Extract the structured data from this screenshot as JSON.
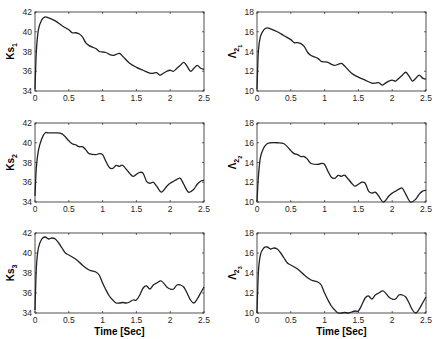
{
  "chart_data": [
    {
      "type": "line",
      "title": "",
      "ylabel": "Ks_1",
      "ylabel_main": "Ks",
      "ylabel_sub": "1",
      "xlabel": "",
      "xlim": [
        0,
        2.5
      ],
      "ylim": [
        34,
        42
      ],
      "xticks": [
        "0",
        "0.5",
        "1",
        "1.5",
        "2",
        "2.5"
      ],
      "yticks": [
        "34",
        "36",
        "38",
        "40",
        "42"
      ],
      "grid": false,
      "x": [
        0,
        0.02,
        0.05,
        0.1,
        0.15,
        0.2,
        0.3,
        0.4,
        0.5,
        0.55,
        0.6,
        0.65,
        0.7,
        0.75,
        0.8,
        0.9,
        0.95,
        1.0,
        1.05,
        1.1,
        1.15,
        1.2,
        1.25,
        1.3,
        1.4,
        1.5,
        1.6,
        1.7,
        1.75,
        1.8,
        1.85,
        1.9,
        1.95,
        2.0,
        2.05,
        2.1,
        2.15,
        2.2,
        2.25,
        2.3,
        2.35,
        2.4,
        2.45,
        2.5
      ],
      "values": [
        34.2,
        38.0,
        40.2,
        41.2,
        41.5,
        41.4,
        41.1,
        40.6,
        40.2,
        39.9,
        39.9,
        39.8,
        39.5,
        38.9,
        38.6,
        38.3,
        38.0,
        37.95,
        37.9,
        37.7,
        37.6,
        37.7,
        37.8,
        37.5,
        36.8,
        36.4,
        36.1,
        35.8,
        35.8,
        35.85,
        35.6,
        35.8,
        36.0,
        36.1,
        36.0,
        36.3,
        36.6,
        36.9,
        36.5,
        36.0,
        36.3,
        36.6,
        36.3,
        36.2
      ]
    },
    {
      "type": "line",
      "title": "",
      "ylabel": "Λ2_1",
      "ylabel_main": "Λ",
      "ylabel_sub": "2",
      "ylabel_subsub": "1",
      "xlabel": "",
      "xlim": [
        0,
        2.5
      ],
      "ylim": [
        10,
        18
      ],
      "xticks": [
        "0",
        "0.5",
        "1",
        "1.5",
        "2",
        "2.5"
      ],
      "yticks": [
        "10",
        "12",
        "14",
        "16",
        "18"
      ],
      "grid": false,
      "x": [
        0,
        0.02,
        0.05,
        0.1,
        0.15,
        0.2,
        0.3,
        0.4,
        0.5,
        0.55,
        0.6,
        0.65,
        0.7,
        0.75,
        0.8,
        0.9,
        0.95,
        1.0,
        1.05,
        1.1,
        1.15,
        1.2,
        1.25,
        1.3,
        1.4,
        1.5,
        1.6,
        1.7,
        1.75,
        1.8,
        1.85,
        1.9,
        1.95,
        2.0,
        2.05,
        2.1,
        2.15,
        2.2,
        2.25,
        2.3,
        2.35,
        2.4,
        2.45,
        2.5
      ],
      "values": [
        10.2,
        14.0,
        15.5,
        16.2,
        16.4,
        16.3,
        16.0,
        15.6,
        15.2,
        14.9,
        14.9,
        14.8,
        14.5,
        13.9,
        13.6,
        13.3,
        13.0,
        12.95,
        12.9,
        12.7,
        12.6,
        12.7,
        12.8,
        12.5,
        11.8,
        11.4,
        11.1,
        10.8,
        10.8,
        10.85,
        10.6,
        10.8,
        11.0,
        11.1,
        11.0,
        11.3,
        11.6,
        11.9,
        11.5,
        11.0,
        11.3,
        11.6,
        11.3,
        11.2
      ]
    },
    {
      "type": "line",
      "title": "",
      "ylabel": "Ks_2",
      "ylabel_main": "Ks",
      "ylabel_sub": "2",
      "xlabel": "",
      "xlim": [
        0,
        2.5
      ],
      "ylim": [
        34,
        42
      ],
      "xticks": [
        "0",
        "0.5",
        "1",
        "1.5",
        "2",
        "2.5"
      ],
      "yticks": [
        "34",
        "36",
        "38",
        "40",
        "42"
      ],
      "grid": false,
      "x": [
        0,
        0.02,
        0.05,
        0.1,
        0.15,
        0.2,
        0.3,
        0.4,
        0.5,
        0.55,
        0.6,
        0.65,
        0.7,
        0.75,
        0.8,
        0.9,
        0.95,
        1.0,
        1.05,
        1.1,
        1.15,
        1.2,
        1.25,
        1.3,
        1.4,
        1.45,
        1.5,
        1.55,
        1.6,
        1.65,
        1.7,
        1.75,
        1.8,
        1.87,
        1.95,
        2.0,
        2.05,
        2.1,
        2.15,
        2.2,
        2.27,
        2.35,
        2.4,
        2.45,
        2.5
      ],
      "values": [
        34.6,
        37.5,
        39.2,
        40.4,
        41.0,
        41.0,
        41.0,
        40.9,
        40.2,
        39.9,
        39.8,
        39.6,
        39.6,
        39.3,
        38.9,
        38.8,
        38.9,
        38.8,
        38.1,
        37.5,
        37.4,
        37.7,
        37.6,
        37.7,
        36.9,
        36.6,
        36.8,
        37.0,
        36.9,
        36.1,
        35.9,
        36.0,
        35.6,
        35.0,
        35.6,
        35.9,
        36.1,
        36.3,
        36.4,
        35.8,
        35.0,
        35.3,
        35.8,
        36.1,
        36.2
      ]
    },
    {
      "type": "line",
      "title": "",
      "ylabel": "Λ2_2",
      "ylabel_main": "Λ",
      "ylabel_sub": "2",
      "ylabel_subsub": "2",
      "xlabel": "",
      "xlim": [
        0,
        2.5
      ],
      "ylim": [
        10,
        18
      ],
      "xticks": [
        "0",
        "0.5",
        "1",
        "1.5",
        "2",
        "2.5"
      ],
      "yticks": [
        "10",
        "12",
        "14",
        "16",
        "18"
      ],
      "grid": false,
      "x": [
        0,
        0.02,
        0.05,
        0.1,
        0.15,
        0.2,
        0.3,
        0.4,
        0.5,
        0.55,
        0.6,
        0.65,
        0.7,
        0.75,
        0.8,
        0.9,
        0.95,
        1.0,
        1.05,
        1.1,
        1.15,
        1.2,
        1.25,
        1.3,
        1.4,
        1.45,
        1.5,
        1.55,
        1.6,
        1.65,
        1.7,
        1.75,
        1.8,
        1.87,
        1.95,
        2.0,
        2.05,
        2.1,
        2.15,
        2.2,
        2.27,
        2.35,
        2.4,
        2.45,
        2.5
      ],
      "values": [
        10.0,
        12.5,
        14.5,
        15.5,
        15.9,
        16.0,
        16.0,
        15.9,
        15.2,
        14.9,
        14.8,
        14.6,
        14.6,
        14.3,
        13.9,
        13.8,
        13.9,
        13.8,
        13.1,
        12.5,
        12.4,
        12.7,
        12.6,
        12.7,
        11.9,
        11.6,
        11.8,
        12.0,
        11.9,
        11.1,
        10.9,
        11.0,
        10.6,
        10.0,
        10.6,
        10.9,
        11.1,
        11.3,
        11.4,
        10.8,
        10.0,
        10.3,
        10.8,
        11.1,
        11.2
      ]
    },
    {
      "type": "line",
      "title": "",
      "ylabel": "Ks_3",
      "ylabel_main": "Ks",
      "ylabel_sub": "3",
      "xlabel": "Time [Sec]",
      "xlim": [
        0,
        2.5
      ],
      "ylim": [
        34,
        42
      ],
      "xticks": [
        "0",
        "0.5",
        "1",
        "1.5",
        "2",
        "2.5"
      ],
      "yticks": [
        "34",
        "36",
        "38",
        "40",
        "42"
      ],
      "grid": false,
      "x": [
        0,
        0.02,
        0.05,
        0.1,
        0.15,
        0.2,
        0.25,
        0.3,
        0.35,
        0.4,
        0.45,
        0.5,
        0.6,
        0.7,
        0.8,
        0.9,
        0.95,
        1.0,
        1.05,
        1.1,
        1.15,
        1.2,
        1.25,
        1.3,
        1.35,
        1.4,
        1.45,
        1.5,
        1.55,
        1.6,
        1.65,
        1.7,
        1.75,
        1.8,
        1.87,
        1.95,
        2.0,
        2.05,
        2.1,
        2.15,
        2.2,
        2.25,
        2.3,
        2.35,
        2.4,
        2.45,
        2.5
      ],
      "values": [
        34.3,
        38.5,
        40.5,
        41.4,
        41.6,
        41.4,
        41.5,
        41.4,
        41.0,
        40.5,
        40.0,
        39.8,
        39.4,
        38.8,
        38.3,
        38.1,
        37.8,
        37.0,
        36.3,
        35.7,
        35.3,
        35.0,
        35.0,
        35.05,
        35.0,
        35.1,
        35.3,
        35.3,
        35.8,
        36.5,
        36.7,
        36.4,
        36.8,
        37.0,
        37.2,
        36.6,
        36.4,
        36.4,
        36.8,
        36.8,
        36.6,
        36.0,
        35.3,
        35.0,
        35.4,
        36.0,
        36.6
      ]
    },
    {
      "type": "line",
      "title": "",
      "ylabel": "Λ2_3",
      "ylabel_main": "Λ",
      "ylabel_sub": "2",
      "ylabel_subsub": "3",
      "xlabel": "Time [Sec]",
      "xlim": [
        0,
        2.5
      ],
      "ylim": [
        10,
        18
      ],
      "xticks": [
        "0",
        "0.5",
        "1",
        "1.5",
        "2",
        "2.5"
      ],
      "yticks": [
        "10",
        "12",
        "14",
        "16",
        "18"
      ],
      "grid": false,
      "x": [
        0,
        0.02,
        0.05,
        0.1,
        0.15,
        0.2,
        0.25,
        0.3,
        0.35,
        0.4,
        0.45,
        0.5,
        0.6,
        0.7,
        0.8,
        0.9,
        0.95,
        1.0,
        1.05,
        1.1,
        1.15,
        1.2,
        1.25,
        1.3,
        1.35,
        1.4,
        1.45,
        1.5,
        1.55,
        1.6,
        1.65,
        1.7,
        1.75,
        1.8,
        1.87,
        1.95,
        2.0,
        2.05,
        2.1,
        2.15,
        2.2,
        2.25,
        2.3,
        2.35,
        2.4,
        2.45,
        2.5
      ],
      "values": [
        10.0,
        14.0,
        15.8,
        16.5,
        16.6,
        16.4,
        16.5,
        16.4,
        16.0,
        15.5,
        15.0,
        14.8,
        14.4,
        13.8,
        13.3,
        13.1,
        12.8,
        12.0,
        11.3,
        10.7,
        10.3,
        10.0,
        10.0,
        10.05,
        10.0,
        10.1,
        10.2,
        10.2,
        10.8,
        11.5,
        11.7,
        11.4,
        11.8,
        12.0,
        12.2,
        11.6,
        11.4,
        11.4,
        11.8,
        11.8,
        11.6,
        11.0,
        10.3,
        10.0,
        10.4,
        11.0,
        11.6
      ]
    }
  ]
}
